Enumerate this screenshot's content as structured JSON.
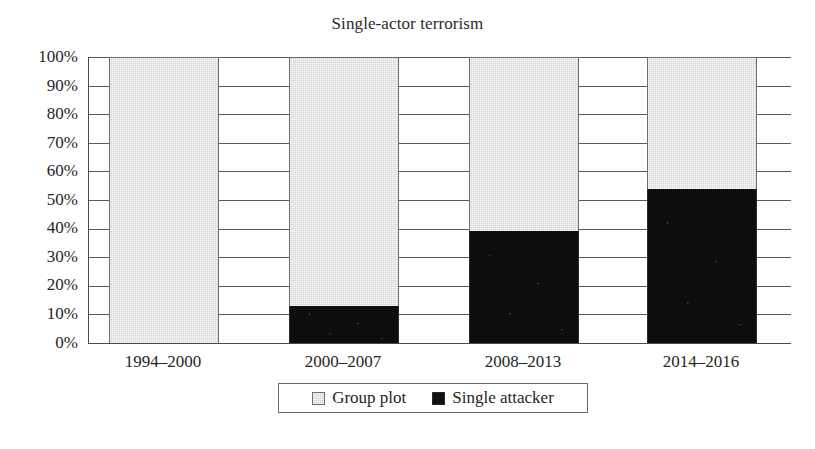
{
  "chart_data": {
    "type": "bar",
    "subtype": "stacked-100-percent",
    "title": "Single-actor terrorism",
    "xlabel": "",
    "ylabel": "",
    "categories": [
      "1994–2000",
      "2000–2007",
      "2008–2013",
      "2014–2016"
    ],
    "series": [
      {
        "name": "Group plot",
        "values": [
          100,
          87,
          61,
          46
        ],
        "color": "#d2d2d2"
      },
      {
        "name": "Single attacker",
        "values": [
          0,
          13,
          39,
          54
        ],
        "color": "#111111"
      }
    ],
    "ylim": [
      0,
      100
    ],
    "ytick_labels": [
      "100%",
      "90%",
      "80%",
      "70%",
      "60%",
      "50%",
      "40%",
      "30%",
      "20%",
      "10%",
      "0%"
    ],
    "ytick_values": [
      100,
      90,
      80,
      70,
      60,
      50,
      40,
      30,
      20,
      10,
      0
    ],
    "grid": true,
    "grid_axis": "y",
    "legend_position": "bottom",
    "legend_entries": [
      "Group plot",
      "Single attacker"
    ]
  },
  "legend": {
    "items": [
      {
        "label": "Group plot",
        "swatch": "gray-square-swatch"
      },
      {
        "label": "Single attacker",
        "swatch": "black-square-swatch"
      }
    ]
  },
  "colors": {
    "group_plot": "#d2d2d2",
    "single_attacker": "#111111",
    "axis": "#4a4a4a",
    "gridline": "#5a5a5a",
    "text": "#262626",
    "background": "#ffffff"
  }
}
